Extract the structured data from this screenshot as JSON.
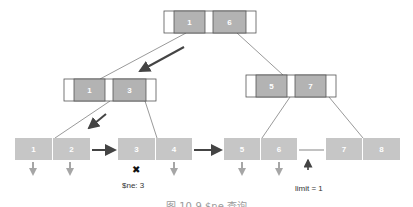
{
  "diagram": {
    "type": "b-plus-tree-query",
    "colors": {
      "node_fill": "#b3b3b3",
      "node_border": "#555555",
      "pointer_slot": "#ffffff",
      "leaf_fill": "#c6c6c6",
      "edge": "#9a9a9a",
      "traversal_arrow": "#444444",
      "down_arrow": "#a6a6a6"
    },
    "root": {
      "keys": [
        "1",
        "6"
      ]
    },
    "internal": [
      {
        "id": "left",
        "keys": [
          "1",
          "3"
        ]
      },
      {
        "id": "right",
        "keys": [
          "5",
          "7"
        ]
      }
    ],
    "leaves": [
      {
        "keys": [
          "1",
          "2"
        ]
      },
      {
        "keys": [
          "3",
          "4"
        ]
      },
      {
        "keys": [
          "5",
          "6"
        ]
      },
      {
        "keys": [
          "7",
          "8"
        ]
      }
    ],
    "annotations": {
      "excluded_marker": "✖",
      "ne_label": "$ne: 3",
      "limit_label": "limit = 1"
    },
    "caption": "图 10-9  $ne 查询"
  }
}
